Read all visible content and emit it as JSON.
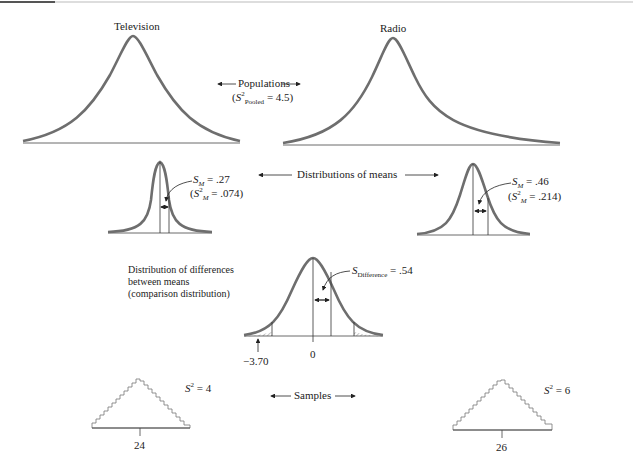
{
  "figure": {
    "populations": {
      "left_title": "Television",
      "right_title": "Radio",
      "center_label": "Populations",
      "pooled_variance_symbol": "S",
      "pooled_variance_sup": "2",
      "pooled_variance_sub": "Pooled",
      "pooled_variance_value": "= 4.5"
    },
    "distributions_of_means": {
      "center_label": "Distributions of means",
      "left": {
        "sd_symbol": "S",
        "sd_sub": "M",
        "sd_value": "= .27",
        "var_symbol": "S",
        "var_sup": "2",
        "var_sub": "M",
        "var_value": "= .074"
      },
      "right": {
        "sd_symbol": "S",
        "sd_sub": "M",
        "sd_value": "= .46",
        "var_symbol": "S",
        "var_sup": "2",
        "var_sub": "M",
        "var_value": "= .214"
      }
    },
    "difference_distribution": {
      "label_line1": "Distribution of differences",
      "label_line2": "between means",
      "label_line3": "(comparison distribution)",
      "sd_symbol": "S",
      "sd_sub": "Difference",
      "sd_value": "= .54",
      "center_tick": "0",
      "sample_marker": "−3.70"
    },
    "samples": {
      "center_label": "Samples",
      "left": {
        "var_symbol": "S",
        "var_sup": "2",
        "var_value": "= 4",
        "mean": "24"
      },
      "right": {
        "var_symbol": "S",
        "var_sup": "2",
        "var_value": "= 6",
        "mean": "26"
      }
    },
    "colors": {
      "curve": "#6e6e6e",
      "line": "#333333",
      "hatch": "#888888"
    }
  }
}
